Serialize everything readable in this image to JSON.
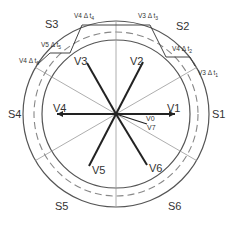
{
  "diagram": {
    "sectors": [
      {
        "id": "S1",
        "label": "S1",
        "x": 212,
        "y": 118
      },
      {
        "id": "S2",
        "label": "S2",
        "x": 176,
        "y": 30
      },
      {
        "id": "S3",
        "label": "S3",
        "x": 45,
        "y": 28
      },
      {
        "id": "S4",
        "label": "S4",
        "x": 8,
        "y": 118
      },
      {
        "id": "S5",
        "label": "S5",
        "x": 55,
        "y": 210
      },
      {
        "id": "S6",
        "label": "S6",
        "x": 168,
        "y": 210
      }
    ],
    "vectors": [
      {
        "id": "V1",
        "label": "V1",
        "x2": 175,
        "y2": 114,
        "lx": 167,
        "ly": 112
      },
      {
        "id": "V2",
        "label": "V2",
        "x2": 143,
        "y2": 62,
        "lx": 130,
        "ly": 65
      },
      {
        "id": "V3",
        "label": "V3",
        "x2": 87,
        "y2": 63,
        "lx": 74,
        "ly": 65
      },
      {
        "id": "V4",
        "label": "V4",
        "x2": 57,
        "y2": 114,
        "lx": 53,
        "ly": 112
      },
      {
        "id": "V5",
        "label": "V5",
        "x2": 89,
        "y2": 166,
        "lx": 92,
        "ly": 174
      },
      {
        "id": "V6",
        "label": "V6",
        "x2": 147,
        "y2": 165,
        "lx": 149,
        "ly": 172
      }
    ],
    "zero_vectors": [
      {
        "id": "V0",
        "label": "V0",
        "lx": 146,
        "ly": 121
      },
      {
        "id": "V7",
        "label": "V7",
        "lx": 147,
        "ly": 130
      }
    ],
    "time_labels": [
      {
        "text": "V3 Δ t",
        "sub": "1",
        "x": 198,
        "y": 75
      },
      {
        "text": "V4 Δ t",
        "sub": "2",
        "x": 172,
        "y": 51
      },
      {
        "text": "V3 Δ t",
        "sub": "3",
        "x": 138,
        "y": 18
      },
      {
        "text": "V4 Δ t",
        "sub": "4",
        "x": 74,
        "y": 18
      },
      {
        "text": "V5 Δ t",
        "sub": "5",
        "x": 41,
        "y": 47
      },
      {
        "text": "V4 Δ t",
        "sub": "6",
        "x": 19,
        "y": 63
      }
    ]
  }
}
